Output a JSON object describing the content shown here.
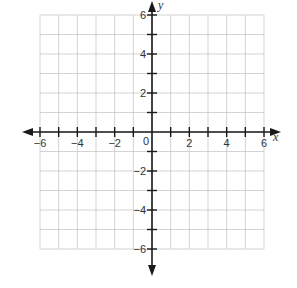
{
  "chart_data": {
    "type": "line",
    "title": "",
    "xlabel": "x",
    "ylabel": "y",
    "xlim": [
      -6,
      6
    ],
    "ylim": [
      -6,
      6
    ],
    "grid": true,
    "grid_step": 1,
    "x_ticks": [
      -6,
      -5,
      -4,
      -3,
      -2,
      -1,
      0,
      1,
      2,
      3,
      4,
      5,
      6
    ],
    "y_ticks": [
      -6,
      -5,
      -4,
      -3,
      -2,
      -1,
      0,
      1,
      2,
      3,
      4,
      5,
      6
    ],
    "x_tick_labels": [
      "-6",
      "-4",
      "-2",
      "2",
      "4",
      "6"
    ],
    "x_tick_label_values": [
      -6,
      -4,
      -2,
      2,
      4,
      6
    ],
    "y_tick_labels": [
      "6",
      "4",
      "2",
      "-2",
      "-4",
      "-6"
    ],
    "y_tick_label_values": [
      6,
      4,
      2,
      -2,
      -4,
      -6
    ],
    "origin_label": "0",
    "series": [],
    "legend": null
  },
  "colors": {
    "grid": "#c8c8c8",
    "axis": "#1a1a1a",
    "text": "#333333"
  }
}
